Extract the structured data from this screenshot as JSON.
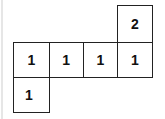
{
  "diagram": {
    "cells": [
      {
        "id": "top",
        "row": 0,
        "col": 3,
        "value": "2"
      },
      {
        "id": "r1c0",
        "row": 1,
        "col": 0,
        "value": "1"
      },
      {
        "id": "r1c1",
        "row": 1,
        "col": 1,
        "value": "1"
      },
      {
        "id": "r1c2",
        "row": 1,
        "col": 2,
        "value": "1"
      },
      {
        "id": "r1c3",
        "row": 1,
        "col": 3,
        "value": "1"
      },
      {
        "id": "bottom",
        "row": 2,
        "col": 0,
        "value": "1"
      }
    ],
    "colors": {
      "border": "#222222",
      "text": "#111111",
      "background": "#ffffff"
    }
  }
}
